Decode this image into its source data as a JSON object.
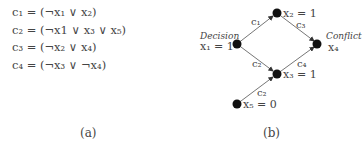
{
  "panel_a": {
    "clauses": [
      "c₁ = (¬x₁ ∨ x₂)",
      "c₂ = (¬x1 ∨ x₃ ∨ x₅)",
      "c₃ = (¬x₂ ∨ x₄)",
      "c₄ = (¬x₃ ∨ ¬x₄)"
    ],
    "caption": "(a)"
  },
  "panel_b": {
    "caption": "(b)",
    "nodes": {
      "x1": {
        "tag": "Decision",
        "label": "x₁ = 1"
      },
      "x2": {
        "label": "x₂ = 1"
      },
      "x3": {
        "label": "x₃ = 1"
      },
      "x4": {
        "tag": "Conflict",
        "label": "x₄"
      },
      "x5": {
        "label": "x₅ = 0"
      }
    },
    "edges": {
      "x1_x2": "c₁",
      "x1_x3": "c₂",
      "x2_x4": "c₃",
      "x3_x4": "c₄",
      "x5_x3": "c₂"
    }
  }
}
